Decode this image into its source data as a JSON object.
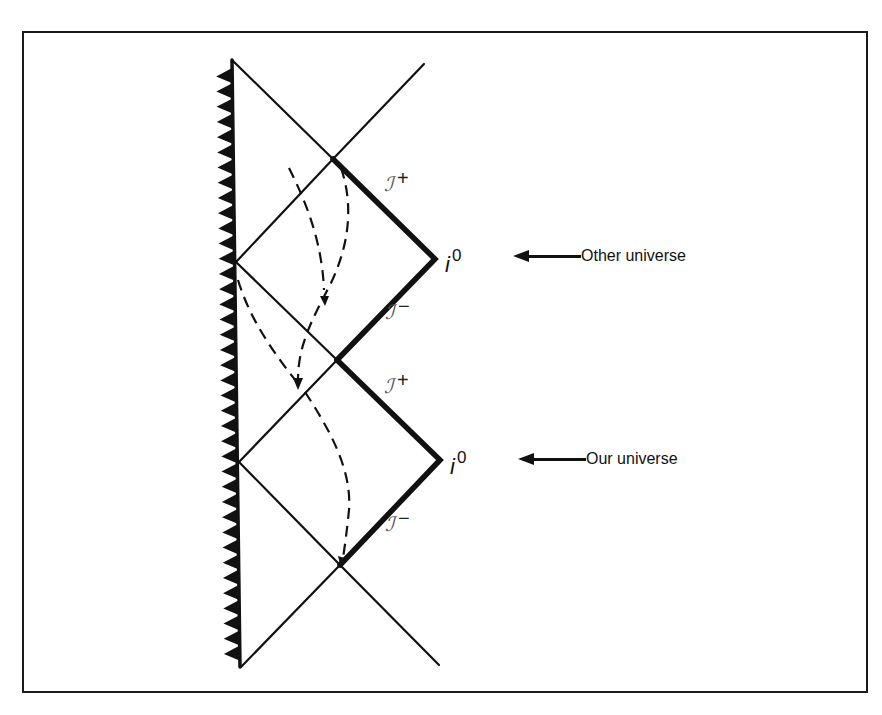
{
  "diagram": {
    "type": "penrose-diagram",
    "singularity": {
      "style": "zigzag",
      "side": "left"
    },
    "labels": {
      "scri_plus_upper": {
        "symbol": "ℐ",
        "sign": "+"
      },
      "scri_minus_upper": {
        "symbol": "ℐ",
        "sign": "−"
      },
      "scri_plus_lower": {
        "symbol": "ℐ",
        "sign": "+"
      },
      "scri_minus_lower": {
        "symbol": "ℐ",
        "sign": "−"
      },
      "io_upper": {
        "symbol": "i",
        "sup": "0"
      },
      "io_lower": {
        "symbol": "i",
        "sup": "0"
      }
    },
    "callouts": [
      {
        "label": "Other universe",
        "points_to": "upper spatial infinity"
      },
      {
        "label": "Our universe",
        "points_to": "lower spatial infinity"
      }
    ],
    "trajectories": {
      "count": 4,
      "style": "dashed",
      "note": "Timelike worldlines passing through successive regions"
    }
  },
  "colors": {
    "background": "#ffffff",
    "ink": "#111111",
    "scri_ink": "#555555"
  }
}
